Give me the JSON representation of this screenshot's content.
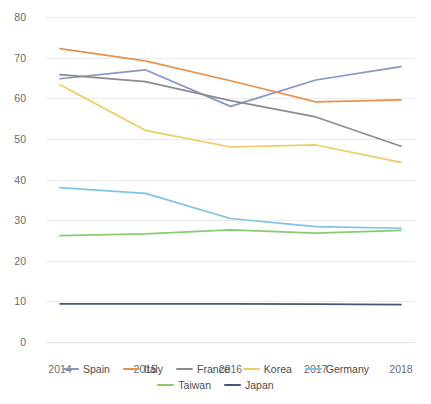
{
  "title": "",
  "bottom_caption": "",
  "axis": {
    "y_ticks": [
      "0",
      "10",
      "20",
      "30",
      "40",
      "50",
      "60",
      "70",
      "80"
    ],
    "x_ticks": [
      "2014",
      "2015",
      "2016",
      "2017",
      "2018"
    ]
  },
  "legend": {
    "row1": [
      {
        "label": "Spain",
        "color": "#8595c8"
      },
      {
        "label": "Italy",
        "color": "#e8914d"
      },
      {
        "label": "France",
        "color": "#8c8c8c"
      },
      {
        "label": "Korea",
        "color": "#f0cc5e"
      },
      {
        "label": "Germany",
        "color": "#7ec3e8"
      }
    ],
    "row2": [
      {
        "label": "Taiwan",
        "color": "#85cc72"
      },
      {
        "label": "Japan",
        "color": "#4a5478"
      }
    ]
  },
  "chart_data": {
    "type": "line",
    "title": "",
    "xlabel": "",
    "ylabel": "",
    "x": [
      "2014",
      "2015",
      "2016",
      "2017",
      "2018"
    ],
    "ylim": [
      0,
      80
    ],
    "xlim": [
      "2014",
      "2018"
    ],
    "grid": true,
    "legend_position": "bottom",
    "series": [
      {
        "name": "Spain",
        "color": "#8595c8",
        "values": [
          64.8,
          67.0,
          58.0,
          64.5,
          67.8
        ]
      },
      {
        "name": "Italy",
        "color": "#e8914d",
        "values": [
          72.2,
          69.2,
          64.3,
          59.1,
          59.6
        ]
      },
      {
        "name": "France",
        "color": "#8c8c8c",
        "values": [
          65.8,
          64.1,
          59.4,
          55.4,
          48.2
        ]
      },
      {
        "name": "Korea",
        "color": "#f0cc5e",
        "values": [
          63.3,
          52.1,
          48.0,
          48.5,
          44.2
        ]
      },
      {
        "name": "Germany",
        "color": "#7ec3e8",
        "values": [
          38.0,
          36.6,
          30.4,
          28.4,
          28.0
        ]
      },
      {
        "name": "Taiwan",
        "color": "#85cc72",
        "values": [
          26.2,
          26.6,
          27.6,
          26.8,
          27.5
        ]
      },
      {
        "name": "Japan",
        "color": "#4a5478",
        "values": [
          9.4,
          9.4,
          9.4,
          9.3,
          9.2
        ]
      }
    ]
  }
}
